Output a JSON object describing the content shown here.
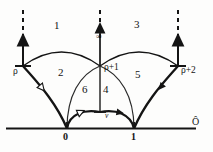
{
  "figure": {
    "colors": {
      "ink": "#141414",
      "background": "#fdfdfc",
      "thin": "#2a2a2a"
    },
    "axis": {
      "name": "real-axis",
      "label": "Ô",
      "ticks": [
        {
          "label": "0",
          "x": 67
        },
        {
          "label": "1",
          "x": 134
        }
      ]
    },
    "cusps": [
      {
        "name": "rho",
        "label": "ρ",
        "x": 23,
        "y": 66
      },
      {
        "name": "rho-plus-1",
        "label": "ρ+1",
        "x": 100,
        "y": 66
      },
      {
        "name": "rho-plus-2",
        "label": "ρ+2",
        "x": 178,
        "y": 66
      }
    ],
    "infinity": {
      "label": "∞"
    },
    "vertex": {
      "label": "v"
    },
    "regions": [
      {
        "label": "1",
        "x": 56,
        "y": 26
      },
      {
        "label": "2",
        "x": 60,
        "y": 73
      },
      {
        "label": "3",
        "x": 136,
        "y": 25
      },
      {
        "label": "4",
        "x": 105,
        "y": 90
      },
      {
        "label": "5",
        "x": 137,
        "y": 73
      },
      {
        "label": "6",
        "x": 84,
        "y": 90
      }
    ],
    "arrowheads": [
      {
        "name": "open-arrow-left-geodesic",
        "style": "open"
      },
      {
        "name": "open-arrow-left-small-arc",
        "style": "open"
      },
      {
        "name": "filled-arrow-right-geodesic",
        "style": "filled"
      },
      {
        "name": "filled-arrow-right-small-arc",
        "style": "filled"
      },
      {
        "name": "up-arrow-left-vertical",
        "style": "filled"
      },
      {
        "name": "up-arrow-center-vertical",
        "style": "filled"
      },
      {
        "name": "up-arrow-right-vertical",
        "style": "filled"
      }
    ]
  }
}
